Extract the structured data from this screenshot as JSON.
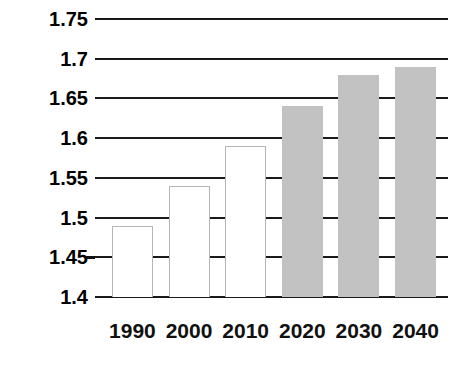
{
  "chart_data": {
    "type": "bar",
    "title": "",
    "subtitle": "",
    "xlabel": "",
    "ylabel": "",
    "categories": [
      "1990",
      "2000",
      "2010",
      "2020",
      "2030",
      "2040"
    ],
    "values": [
      1.49,
      1.54,
      1.59,
      1.64,
      1.68,
      1.69
    ],
    "series": [
      {
        "name": "",
        "values": [
          1.49,
          1.54,
          1.59,
          1.64,
          1.68,
          1.69
        ]
      }
    ],
    "bar_styles": [
      "hollow",
      "hollow",
      "hollow",
      "filled",
      "filled",
      "filled"
    ],
    "ylim": [
      1.4,
      1.75
    ],
    "ytick_labels": [
      "1.75",
      "1.7",
      "1.65",
      "1.6",
      "1.55",
      "1.5",
      "1.45",
      "1.4"
    ],
    "ytick_values": [
      1.75,
      1.7,
      1.65,
      1.6,
      1.55,
      1.5,
      1.45,
      1.4
    ],
    "xtick_labels": [
      "1990",
      "2000",
      "2010",
      "2020",
      "2030",
      "2040"
    ],
    "grid": true,
    "grid_axis": "y",
    "legend": false,
    "legend_position": "none",
    "annotations": [],
    "colors": {
      "bar_filled": "#c2c2c2",
      "bar_hollow_fill": "#ffffff",
      "bar_hollow_border": "#b5b5b5",
      "gridline": "#1a1a1a",
      "axis": "#1a1a1a",
      "text": "#000000",
      "background": "#ffffff"
    }
  }
}
